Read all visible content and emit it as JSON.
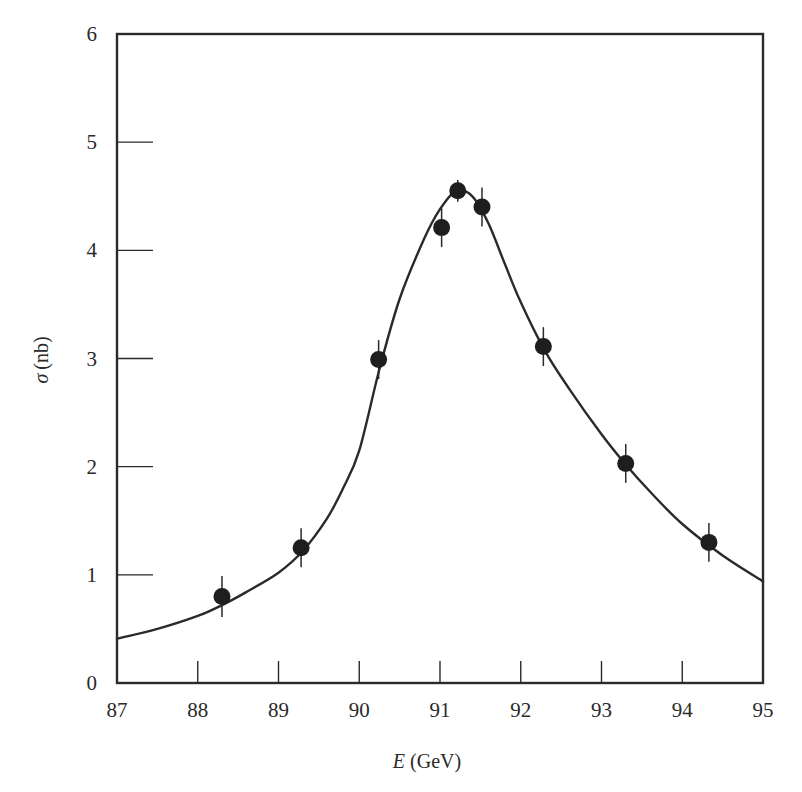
{
  "chart_data": {
    "type": "scatter",
    "title": "",
    "xlabel": "E (GeV)",
    "xlabel_italic": "E",
    "xlabel_unit": "(GeV)",
    "ylabel": "σ (nb)",
    "ylabel_symbol": "σ",
    "ylabel_unit": "(nb)",
    "xlim": [
      87,
      95
    ],
    "ylim": [
      0,
      6
    ],
    "x_ticks": [
      87,
      88,
      89,
      90,
      91,
      92,
      93,
      94,
      95
    ],
    "y_ticks": [
      0,
      1,
      2,
      3,
      4,
      5,
      6
    ],
    "grid": false,
    "legend": null,
    "series": [
      {
        "name": "Measured cross section",
        "kind": "scatter_errorbar",
        "x": [
          88.3,
          89.28,
          90.24,
          91.02,
          91.22,
          91.52,
          92.28,
          93.3,
          94.33
        ],
        "y": [
          0.8,
          1.25,
          2.99,
          4.21,
          4.55,
          4.4,
          3.11,
          2.03,
          1.3
        ],
        "yerr": [
          0.19,
          0.18,
          0.18,
          0.18,
          0.1,
          0.18,
          0.18,
          0.18,
          0.18
        ]
      },
      {
        "name": "Fit curve",
        "kind": "line",
        "x": [
          87.0,
          87.5,
          88.0,
          88.3,
          88.6,
          89.0,
          89.3,
          89.6,
          89.8,
          90.0,
          90.25,
          90.5,
          90.8,
          91.0,
          91.2,
          91.4,
          91.6,
          91.8,
          92.0,
          92.3,
          92.6,
          93.0,
          93.3,
          93.6,
          94.0,
          94.5,
          95.0
        ],
        "y": [
          0.41,
          0.5,
          0.62,
          0.72,
          0.84,
          1.02,
          1.22,
          1.52,
          1.8,
          2.15,
          2.9,
          3.55,
          4.1,
          4.38,
          4.55,
          4.5,
          4.25,
          3.88,
          3.52,
          3.07,
          2.72,
          2.3,
          2.02,
          1.77,
          1.47,
          1.18,
          0.94
        ]
      }
    ]
  },
  "caption": "The Z boson resonance: cross section vs energy"
}
